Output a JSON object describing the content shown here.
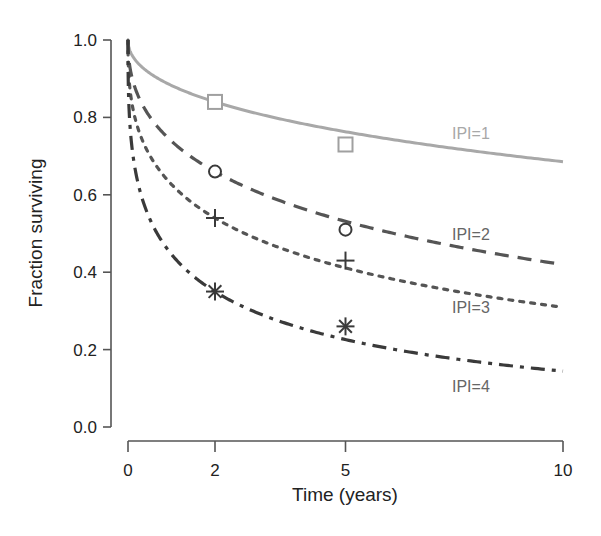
{
  "chart_data": {
    "type": "line",
    "title": "",
    "xlabel": "Time (years)",
    "ylabel": "Fraction surviving",
    "xlim": [
      0,
      10
    ],
    "ylim": [
      0.0,
      1.0
    ],
    "x_ticks": [
      0,
      2,
      5,
      10
    ],
    "x_tick_labels": [
      "0",
      "2",
      "5",
      "10"
    ],
    "y_ticks": [
      0.0,
      0.2,
      0.4,
      0.6,
      0.8,
      1.0
    ],
    "y_tick_labels": [
      "0.0",
      "0.2",
      "0.4",
      "0.6",
      "0.8",
      "1.0"
    ],
    "grid": false,
    "legend_position": "inline labels at right end of each curve",
    "series": [
      {
        "name": "IPI=1",
        "style": "solid",
        "color": "#a8a8a8",
        "marker": "square",
        "points": {
          "x": [
            2,
            5
          ],
          "y": [
            0.84,
            0.73
          ]
        },
        "curve": {
          "x": [
            0,
            2,
            5,
            10
          ],
          "y": [
            1.0,
            0.84,
            0.76,
            0.685
          ]
        },
        "model": {
          "a": 0.125,
          "k": 0.48
        }
      },
      {
        "name": "IPI=2",
        "style": "dashed",
        "color": "#555555",
        "marker": "circle",
        "points": {
          "x": [
            2,
            5
          ],
          "y": [
            0.66,
            0.51
          ]
        },
        "curve": {
          "x": [
            0,
            2,
            5,
            10
          ],
          "y": [
            1.0,
            0.66,
            0.53,
            0.42
          ]
        },
        "model": {
          "a": 0.303,
          "k": 0.457
        }
      },
      {
        "name": "IPI=3",
        "style": "dotted",
        "color": "#555555",
        "marker": "plus",
        "points": {
          "x": [
            2,
            5
          ],
          "y": [
            0.54,
            0.43
          ]
        },
        "curve": {
          "x": [
            0,
            2,
            5,
            10
          ],
          "y": [
            1.0,
            0.54,
            0.41,
            0.31
          ]
        },
        "model": {
          "a": 0.467,
          "k": 0.4
        }
      },
      {
        "name": "IPI=4",
        "style": "dash-dot",
        "color": "#3a3a3a",
        "marker": "asterisk",
        "points": {
          "x": [
            2,
            5
          ],
          "y": [
            0.35,
            0.26
          ]
        },
        "curve": {
          "x": [
            0,
            2,
            5,
            10
          ],
          "y": [
            1.0,
            0.35,
            0.24,
            0.145
          ]
        },
        "model": {
          "a": 0.807,
          "k": 0.38
        }
      }
    ],
    "annotations": [
      "IPI=1",
      "IPI=2",
      "IPI=3",
      "IPI=4"
    ]
  }
}
